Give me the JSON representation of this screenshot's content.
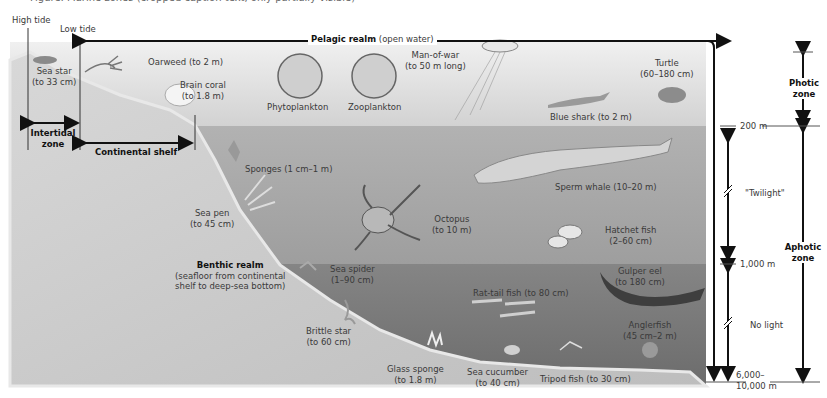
{
  "caption": "Figure: Marine zones (cropped caption text, only partially visible)",
  "tides": {
    "high": "High tide",
    "low": "Low tide"
  },
  "realms": {
    "pelagic": {
      "title": "Pelagic realm",
      "sub": "(open water)"
    },
    "benthic": {
      "title": "Benthic realm",
      "sub1": "(seafloor from continental",
      "sub2": "shelf to deep-sea bottom)"
    }
  },
  "zones": {
    "intertidal": {
      "line1": "Intertidal",
      "line2": "zone"
    },
    "continental_shelf": "Continental shelf",
    "photic": {
      "line1": "Photic",
      "line2": "zone"
    },
    "aphotic": {
      "line1": "Aphotic",
      "line2": "zone"
    },
    "twilight": "\"Twilight\"",
    "no_light": "No light"
  },
  "depths": {
    "d200": "200 m",
    "d1000": "1,000 m",
    "bottom1": "6,000–",
    "bottom2": "10,000 m"
  },
  "organisms": [
    {
      "name": "Sea star",
      "size": "(to 33 cm)"
    },
    {
      "name": "Oarweed (to 2 m)"
    },
    {
      "name": "Brain coral",
      "size": "(to 1.8 m)"
    },
    {
      "name": "Phytoplankton"
    },
    {
      "name": "Zooplankton"
    },
    {
      "name": "Man-of-war",
      "size": "(to 50 m long)"
    },
    {
      "name": "Turtle",
      "size": "(60–180 cm)"
    },
    {
      "name": "Blue shark (to 2 m)"
    },
    {
      "name": "Sponges (1 cm–1 m)"
    },
    {
      "name": "Sea pen",
      "size": "(to 45 cm)"
    },
    {
      "name": "Octopus",
      "size": "(to 10 m)"
    },
    {
      "name": "Sperm whale (10–20 m)"
    },
    {
      "name": "Hatchet fish",
      "size": "(2–60 cm)"
    },
    {
      "name": "Sea spider",
      "size": "(1–90 cm)"
    },
    {
      "name": "Gulper eel",
      "size": "(to 180 cm)"
    },
    {
      "name": "Rat-tail fish (to 80 cm)"
    },
    {
      "name": "Anglerfish",
      "size": "(45 cm–2 m)"
    },
    {
      "name": "Brittle star",
      "size": "(to 60 cm)"
    },
    {
      "name": "Glass sponge",
      "size": "(to 1.8 m)"
    },
    {
      "name": "Sea cucumber",
      "size": "(to 40 cm)"
    },
    {
      "name": "Tripod fish (to 30 cm)"
    }
  ],
  "colors": {
    "photic": "#d9d9d9",
    "twilight": "#ababab",
    "no_light": "#7c7c7c",
    "seafloor": "#c4c4c4"
  }
}
